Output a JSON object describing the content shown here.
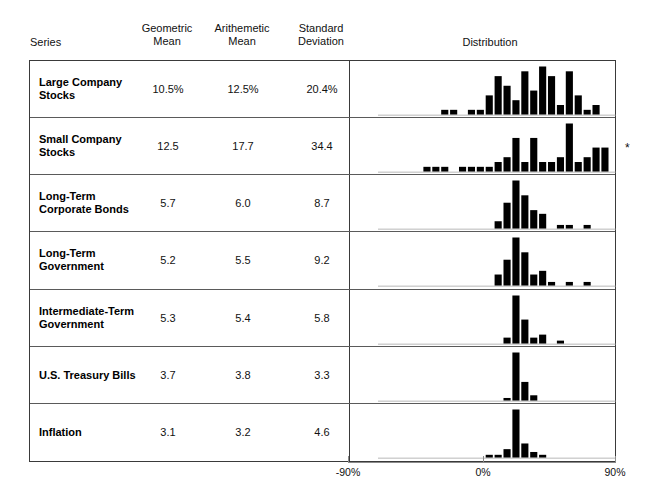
{
  "header": {
    "series_label": "Series",
    "geometric_mean_label": "Geometric\nMean",
    "arithmetic_mean_label": "Arithemetic\nMean",
    "standard_deviation_label": "Standard\nDeviation",
    "distribution_label": "Distribution"
  },
  "axis": {
    "left_label": "-90%",
    "center_label": "0%",
    "right_label": "90%",
    "min": -90,
    "max": 90,
    "zero": 0
  },
  "footnote_mark": "*",
  "colors": {
    "bar": "#000000",
    "border": "#3a3a3a",
    "row_divider": "#5a5a5a",
    "axis": "#8a8a8a",
    "text": "#111111",
    "background": "#ffffff"
  },
  "rows": [
    {
      "name": "Large Company\nStocks",
      "geometric_mean": "10.5%",
      "arithmetic_mean": "12.5%",
      "standard_deviation": "20.4%"
    },
    {
      "name": "Small Company\nStocks",
      "geometric_mean": "12.5",
      "arithmetic_mean": "17.7",
      "standard_deviation": "34.4"
    },
    {
      "name": "Long-Term\nCorporate Bonds",
      "geometric_mean": "5.7",
      "arithmetic_mean": "6.0",
      "standard_deviation": "8.7"
    },
    {
      "name": "Long-Term\nGovernment",
      "geometric_mean": "5.2",
      "arithmetic_mean": "5.5",
      "standard_deviation": "9.2"
    },
    {
      "name": "Intermediate-Term\nGovernment",
      "geometric_mean": "5.3",
      "arithmetic_mean": "5.4",
      "standard_deviation": "5.8"
    },
    {
      "name": "U.S. Treasury Bills",
      "geometric_mean": "3.7",
      "arithmetic_mean": "3.8",
      "standard_deviation": "3.3"
    },
    {
      "name": "Inflation",
      "geometric_mean": "3.1",
      "arithmetic_mean": "3.2",
      "standard_deviation": "4.6"
    }
  ],
  "chart_data": {
    "type": "bar",
    "title": "Distribution",
    "xlabel": "Annual return (%)",
    "ylabel": "Frequency (count of years)",
    "xlim": [
      -90,
      90
    ],
    "grid": false,
    "legend": null,
    "bin_width": 6,
    "note": "Seven stacked histograms of annual total returns, one per series; x-axis shared, spanning -90% to +90% with 0% centered.",
    "histograms": [
      {
        "name": "Large Company Stocks",
        "bin_centers": [
          -45,
          -39,
          -27,
          -21,
          -15,
          -9,
          -3,
          3,
          9,
          15,
          21,
          27,
          33,
          39,
          45
        ],
        "counts": [
          1,
          1,
          1,
          1,
          4,
          8,
          6,
          3,
          9,
          5,
          10,
          8,
          2,
          9,
          4,
          1,
          2
        ],
        "bins": [
          {
            "center": -45,
            "count": 1
          },
          {
            "center": -39,
            "count": 1
          },
          {
            "center": -27,
            "count": 1
          },
          {
            "center": -21,
            "count": 1
          },
          {
            "center": -15,
            "count": 4
          },
          {
            "center": -9,
            "count": 8
          },
          {
            "center": -3,
            "count": 6
          },
          {
            "center": 3,
            "count": 3
          },
          {
            "center": 9,
            "count": 9
          },
          {
            "center": 15,
            "count": 5
          },
          {
            "center": 21,
            "count": 10
          },
          {
            "center": 27,
            "count": 8
          },
          {
            "center": 33,
            "count": 2
          },
          {
            "center": 39,
            "count": 9
          },
          {
            "center": 45,
            "count": 4
          },
          {
            "center": 51,
            "count": 1
          },
          {
            "center": 57,
            "count": 2
          }
        ]
      },
      {
        "name": "Small Company Stocks",
        "bins": [
          {
            "center": -57,
            "count": 1
          },
          {
            "center": -51,
            "count": 1
          },
          {
            "center": -45,
            "count": 1
          },
          {
            "center": -33,
            "count": 1
          },
          {
            "center": -27,
            "count": 1
          },
          {
            "center": -21,
            "count": 1
          },
          {
            "center": -15,
            "count": 1
          },
          {
            "center": -9,
            "count": 2
          },
          {
            "center": -3,
            "count": 3
          },
          {
            "center": 3,
            "count": 7
          },
          {
            "center": 9,
            "count": 2
          },
          {
            "center": 15,
            "count": 7
          },
          {
            "center": 21,
            "count": 2
          },
          {
            "center": 27,
            "count": 2
          },
          {
            "center": 33,
            "count": 3
          },
          {
            "center": 39,
            "count": 10
          },
          {
            "center": 45,
            "count": 2
          },
          {
            "center": 51,
            "count": 3
          },
          {
            "center": 57,
            "count": 5
          },
          {
            "center": 63,
            "count": 5
          },
          {
            "center": 75,
            "count": 2
          },
          {
            "center": 81,
            "count": 1
          },
          {
            "center": 87,
            "count": 4
          },
          {
            "center": 99,
            "count": 1
          },
          {
            "center": 111,
            "count": 1
          },
          {
            "center": 117,
            "count": 1
          }
        ]
      },
      {
        "name": "Long-Term Corporate Bonds",
        "bins": [
          {
            "center": -9,
            "count": 2
          },
          {
            "center": -3,
            "count": 7
          },
          {
            "center": 3,
            "count": 13
          },
          {
            "center": 9,
            "count": 9
          },
          {
            "center": 15,
            "count": 5
          },
          {
            "center": 21,
            "count": 4
          },
          {
            "center": 33,
            "count": 1
          },
          {
            "center": 39,
            "count": 1
          },
          {
            "center": 51,
            "count": 1
          }
        ]
      },
      {
        "name": "Long-Term Government",
        "bins": [
          {
            "center": -9,
            "count": 3
          },
          {
            "center": -3,
            "count": 7
          },
          {
            "center": 3,
            "count": 13
          },
          {
            "center": 9,
            "count": 9
          },
          {
            "center": 15,
            "count": 3
          },
          {
            "center": 21,
            "count": 4
          },
          {
            "center": 27,
            "count": 1
          },
          {
            "center": 39,
            "count": 1
          },
          {
            "center": 51,
            "count": 1
          }
        ]
      },
      {
        "name": "Intermediate-Term Government",
        "bins": [
          {
            "center": -3,
            "count": 2
          },
          {
            "center": 3,
            "count": 16
          },
          {
            "center": 9,
            "count": 8
          },
          {
            "center": 15,
            "count": 2
          },
          {
            "center": 21,
            "count": 3
          },
          {
            "center": 33,
            "count": 1
          }
        ]
      },
      {
        "name": "U.S. Treasury Bills",
        "bins": [
          {
            "center": -3,
            "count": 1
          },
          {
            "center": 3,
            "count": 18
          },
          {
            "center": 9,
            "count": 7
          },
          {
            "center": 15,
            "count": 2
          }
        ]
      },
      {
        "name": "Inflation",
        "bins": [
          {
            "center": -15,
            "count": 1
          },
          {
            "center": -9,
            "count": 1
          },
          {
            "center": -3,
            "count": 3
          },
          {
            "center": 3,
            "count": 17
          },
          {
            "center": 9,
            "count": 5
          },
          {
            "center": 15,
            "count": 2
          },
          {
            "center": 21,
            "count": 1
          }
        ]
      }
    ]
  }
}
